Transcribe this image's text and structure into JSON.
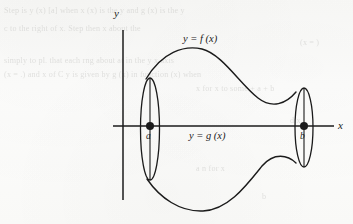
{
  "figure": {
    "kind": "math-diagram",
    "axes": {
      "x_label": "x",
      "y_label": "y",
      "origin_px": [
        123,
        126
      ],
      "x_axis_span_px": [
        113,
        334
      ],
      "y_axis_span_px": [
        30,
        200
      ]
    },
    "labels": {
      "upper_curve": "y = f (x)",
      "lower_curve": "y = g (x)",
      "left_point": "a",
      "right_point": "b",
      "x_axis": "x",
      "y_axis": "y"
    },
    "points": [
      {
        "name": "a",
        "label": "a",
        "cx": 150,
        "cy": 126,
        "r": 4.0
      },
      {
        "name": "b",
        "label": "b",
        "cx": 304,
        "cy": 126,
        "r": 4.0
      }
    ],
    "ellipses": [
      {
        "name": "disc-at-a",
        "cx": 150,
        "cy": 129,
        "rx": 9.5,
        "ry": 51
      },
      {
        "name": "disc-at-b",
        "cx": 304,
        "cy": 127.5,
        "rx": 9.0,
        "ry": 39.5
      }
    ],
    "colors": {
      "ink": "#1b1b1b",
      "paper": "#fbfbfa",
      "ghost_text": "#b9b9b6"
    },
    "stroke_widths": {
      "axis": 1.5,
      "curve": 1.4,
      "ellipse": 1.3
    }
  },
  "ghost_text": {
    "lines": [
      {
        "text": "Step is  y (x) [a]  when  x (x)  is the  y  and  g (x)  is the  y",
        "x": 4,
        "y": 6
      },
      {
        "text": "c to the right of  x.  Step  then  x  about the",
        "x": 4,
        "y": 24
      },
      {
        "text": "(x = )",
        "x": 300,
        "y": 38
      },
      {
        "text": "simply to pl.        that each  rng  about  at  in the  y  x  axis",
        "x": 4,
        "y": 56
      },
      {
        "text": "(x = .)  and  x  of  C y  is  given  by  g (x)  in  function  (x)  when",
        "x": 4,
        "y": 70
      },
      {
        "text": "x  for  x  to  some  +  a  +  b",
        "x": 196,
        "y": 84
      },
      {
        "text": "d  x",
        "x": 290,
        "y": 116
      },
      {
        "text": "a  n  for  x",
        "x": 196,
        "y": 164
      },
      {
        "text": "b",
        "x": 262,
        "y": 192
      }
    ]
  },
  "chart_data": {
    "type": "line",
    "title": "",
    "xlabel": "x",
    "ylabel": "y",
    "annotations": [
      "y = f (x)",
      "y = g (x)",
      "a",
      "b"
    ],
    "series": [
      {
        "name": "y = f (x)",
        "comment": "upper boundary curve: rises from top of left disc, peaks near x=200, falls into top of right disc",
        "path_px": "M 146,79 C 162,52 184,45 202,49 C 222,54 240,84 258,98 C 272,109 286,104 296,92"
      },
      {
        "name": "y = g (x)",
        "comment": "lower boundary curve: drops from bottom of left disc, troughs near x=203, rises into bottom of right disc",
        "path_px": "M 147,179 C 160,198 180,212 203,211 C 228,210 246,186 262,166 C 274,152 288,155 296,163"
      }
    ],
    "grid": false,
    "legend": "none"
  }
}
